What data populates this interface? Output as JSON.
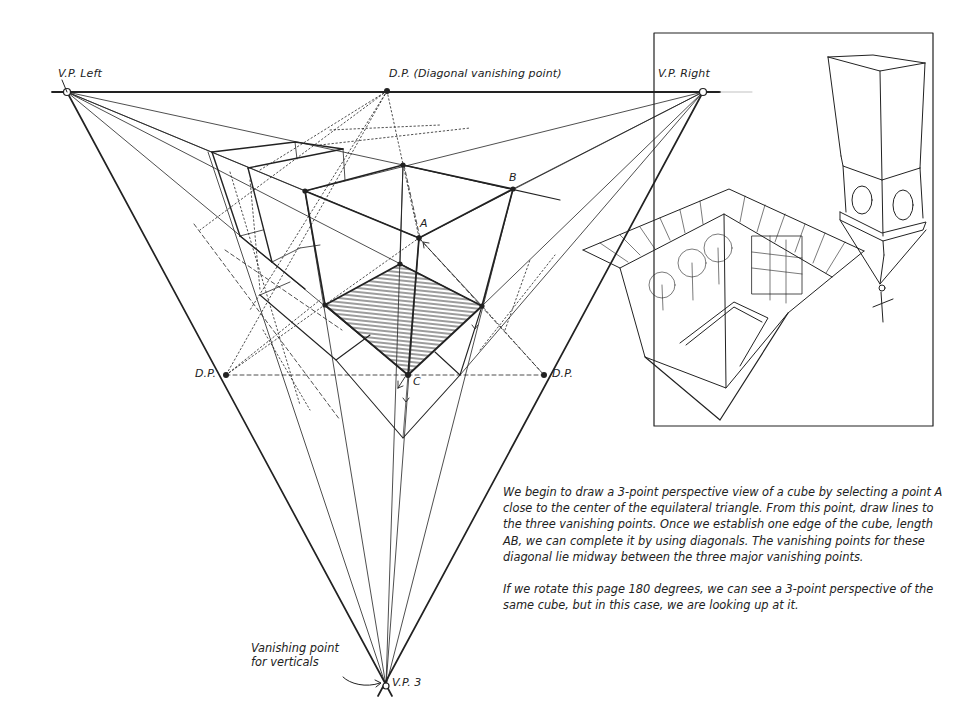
{
  "diagram": {
    "labels": {
      "vp_left": "V.P. Left",
      "vp_right": "V.P. Right",
      "dp_top": "D.P. (Diagonal vanishing point)",
      "dp_left": "D.P.",
      "dp_right": "D.P.",
      "vp3": "V.P. 3",
      "point_a": "A",
      "point_b": "B",
      "point_c": "C",
      "vertical_note_line1": "Vanishing point",
      "vertical_note_line2": "for verticals"
    },
    "points": {
      "vp_left": [
        67,
        92
      ],
      "vp_right": [
        703,
        92
      ],
      "vp3": [
        386,
        686
      ],
      "dp_top": [
        387,
        91
      ],
      "dp_left": [
        226,
        375
      ],
      "dp_right": [
        544,
        375
      ],
      "A": [
        419,
        238
      ],
      "B": [
        513,
        189
      ],
      "C": [
        408,
        375
      ]
    },
    "caption": {
      "paragraph1": "We begin to draw a 3-point perspective view of a cube by selecting a point A close to the center of the equilateral triangle. From this point, draw lines to the three vanishing points. Once we establish one edge of the cube, length AB, we can complete it by using diagonals. The vanishing points for these diagonal lie midway between the three major vanishing points.",
      "paragraph2": "If we rotate this page 180 degrees, we can see a 3-point perspective of the same cube, but in this case, we are looking up at it."
    },
    "inset": {
      "description": "Bird's-eye 3-point perspective sketch of a courtyard and a worm's-eye view of a tower"
    },
    "colors": {
      "ink": "#222222",
      "paper": "#ffffff"
    }
  }
}
